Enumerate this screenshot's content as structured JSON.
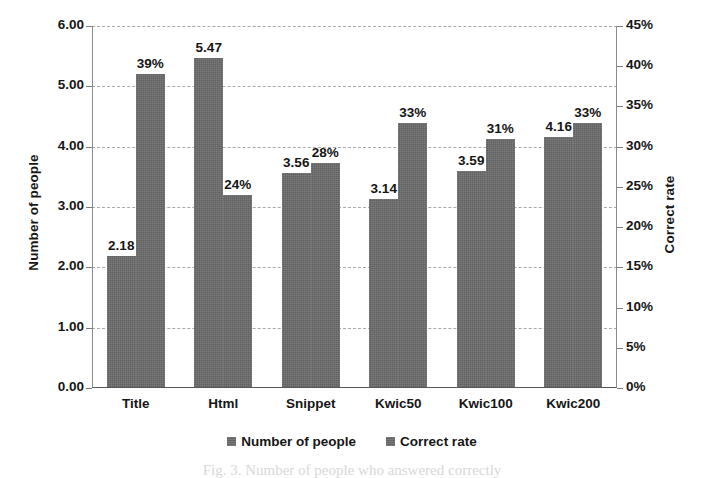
{
  "chart_data": {
    "type": "bar",
    "title": "",
    "subtitle": "",
    "xlabel": "",
    "ylabel": "Number of people",
    "y2label": "Correct rate",
    "categories": [
      "Title",
      "Html",
      "Snippet",
      "Kwic50",
      "Kwic100",
      "Kwic200"
    ],
    "series": [
      {
        "name": "Number of people",
        "axis": "left",
        "values": [
          2.18,
          5.47,
          3.56,
          3.14,
          3.59,
          4.16
        ],
        "labels": [
          "2.18",
          "5.47",
          "3.56",
          "3.14",
          "3.59",
          "4.16"
        ],
        "color": "#6b6b6b"
      },
      {
        "name": "Correct rate",
        "axis": "right",
        "values": [
          39,
          24,
          28,
          33,
          31,
          33
        ],
        "labels": [
          "39%",
          "24%",
          "28%",
          "33%",
          "31%",
          "33%"
        ],
        "color": "#6b6b6b"
      }
    ],
    "ylim": [
      0,
      6
    ],
    "ytick_step": 1,
    "yticks": [
      0,
      1,
      2,
      3,
      4,
      5,
      6
    ],
    "ytick_labels": [
      "0.00",
      "1.00",
      "2.00",
      "3.00",
      "4.00",
      "5.00",
      "6.00"
    ],
    "y2lim": [
      0,
      45
    ],
    "y2tick_step": 5,
    "y2ticks": [
      0,
      5,
      10,
      15,
      20,
      25,
      30,
      35,
      40,
      45
    ],
    "y2tick_labels": [
      "0%",
      "5%",
      "10%",
      "15%",
      "20%",
      "25%",
      "30%",
      "35%",
      "40%",
      "45%"
    ],
    "grid": "horizontal-dashed-on-left-major",
    "legend_position": "bottom-center",
    "legend": [
      "Number of people",
      "Correct rate"
    ]
  },
  "axes": {
    "left_title": "Number of people",
    "right_title": "Correct rate"
  },
  "legend": {
    "entries": [
      {
        "label": "Number of people",
        "swatch": "legend-swatch-number-of-people"
      },
      {
        "label": "Correct rate",
        "swatch": "legend-swatch-correct-rate"
      }
    ]
  },
  "caption": {
    "text": "Fig. 3.  Number of people who answered correctly"
  }
}
